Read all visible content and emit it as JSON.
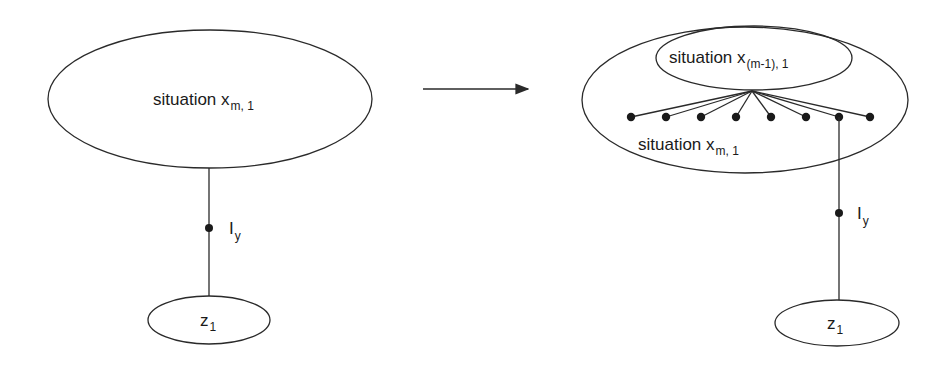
{
  "diagram": {
    "left": {
      "situation": {
        "text": "situation x",
        "subscript": "m, 1"
      },
      "link": {
        "text": "I",
        "subscript": "y"
      },
      "target": {
        "text": "z",
        "subscript": "1"
      }
    },
    "arrow": {
      "direction": "right"
    },
    "right": {
      "inner_situation": {
        "text": "situation x",
        "subscript": "(m-1), 1"
      },
      "outer_situation": {
        "text": "situation x",
        "subscript": "m, 1"
      },
      "fan_dot_count": 8,
      "link": {
        "text": "I",
        "subscript": "y"
      },
      "target": {
        "text": "z",
        "subscript": "1"
      }
    }
  }
}
